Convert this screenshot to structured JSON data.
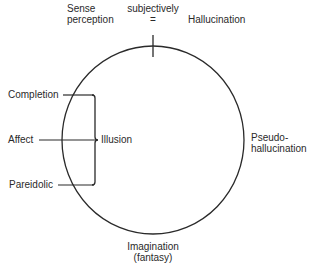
{
  "diagram": {
    "top_labels": {
      "sense_perception_line1": "Sense",
      "sense_perception_line2": "perception",
      "subjectively": "subjectively",
      "equals": "=",
      "hallucination": "Hallucination"
    },
    "right_label": {
      "line1": "Pseudo-",
      "line2": "hallucination"
    },
    "bottom_label": {
      "line1": "Imagination",
      "line2": "(fantasy)"
    },
    "left_items": [
      {
        "label": "Completion"
      },
      {
        "label": "Affect"
      },
      {
        "label": "Pareidolic"
      }
    ],
    "bracket_label": "Illusion",
    "colors": {
      "stroke": "#2a2a2a",
      "background": "#ffffff"
    }
  }
}
